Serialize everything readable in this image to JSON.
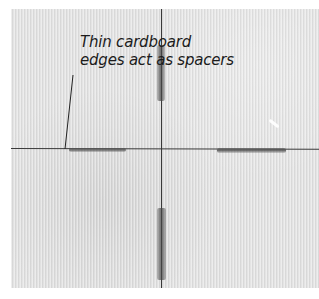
{
  "figure": {
    "annotation": {
      "line1": "Thin cardboard",
      "line2": "edges act as spacers"
    },
    "colors": {
      "tile": "#e4e4e4",
      "grout_line": "#3a3a3a",
      "spacer": "#6e6e6e",
      "text": "#1c1c1c",
      "background": "#ffffff"
    }
  }
}
